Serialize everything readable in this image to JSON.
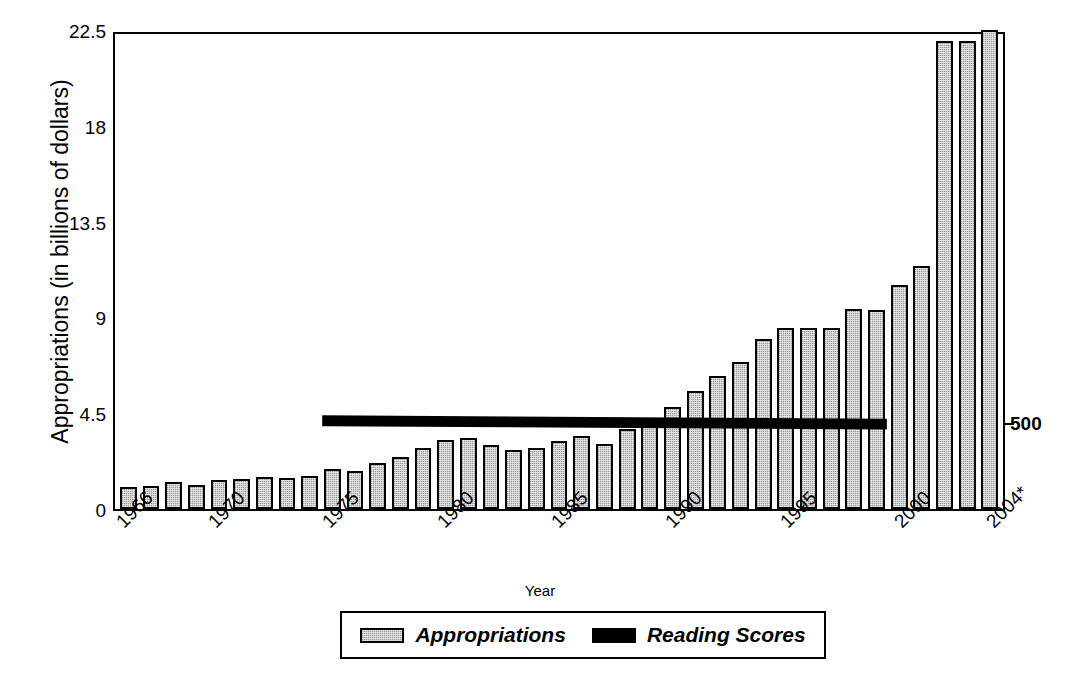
{
  "chart_data": {
    "type": "bar",
    "title": "",
    "xlabel": "Year",
    "ylabel": "Appropriations (in billions of dollars)",
    "ylabel_right": "NAEP Reading Scores",
    "ylim": [
      0,
      22.5
    ],
    "yticks": [
      "0",
      "4.5",
      "9",
      "13.5",
      "18",
      "22.5"
    ],
    "ytick_values": [
      0,
      4.5,
      9,
      13.5,
      18,
      22.5
    ],
    "right_axis_ticks": [
      "500"
    ],
    "right_axis_tick_values": [
      500
    ],
    "grid": false,
    "legend_position": "bottom",
    "categories": [
      "1966",
      "1967",
      "1968",
      "1969",
      "1970",
      "1971",
      "1972",
      "1973",
      "1974",
      "1975",
      "1976",
      "1977",
      "1978",
      "1979",
      "1980",
      "1981",
      "1982",
      "1983",
      "1984",
      "1985",
      "1986",
      "1987",
      "1988",
      "1989",
      "1990",
      "1991",
      "1992",
      "1993",
      "1994",
      "1995",
      "1996",
      "1997",
      "1998",
      "1999",
      "2000",
      "2001",
      "2002",
      "2003",
      "2004*"
    ],
    "xtick_labels": [
      "1966",
      "1970",
      "1975",
      "1980",
      "1985",
      "1990",
      "1995",
      "2000",
      "2004*"
    ],
    "xtick_indices": [
      0,
      4,
      9,
      14,
      19,
      24,
      29,
      34,
      38
    ],
    "series": [
      {
        "name": "Appropriations",
        "type": "bar",
        "color": "#b3b3b3",
        "values": [
          1.05,
          1.1,
          1.25,
          1.15,
          1.35,
          1.4,
          1.5,
          1.45,
          1.55,
          1.9,
          1.8,
          2.15,
          2.45,
          2.85,
          3.25,
          3.35,
          3.0,
          2.75,
          2.85,
          3.2,
          3.45,
          3.05,
          3.75,
          4.0,
          4.8,
          5.55,
          6.25,
          6.9,
          8.0,
          8.5,
          8.5,
          8.5,
          9.4,
          9.35,
          10.5,
          11.4,
          13.7,
          14.9,
          17.3
        ],
        "line_overlay_note": "bars are gray fill with black outline"
      },
      {
        "name": "Reading Scores",
        "type": "line",
        "color": "#000000",
        "axis": "right",
        "start_category": "1975",
        "end_category": "1999",
        "values_flat_near": 500,
        "description": "A thick flat black horizontal line spanning 1975 through 1999 at approximately the 500 NAEP reading score level, showing essentially no change."
      }
    ],
    "extra_tall_bars_note": "2002 and 2003 reach about 22.0; 2004* reaches 22.5 (top of axis)",
    "tall_values_override": {
      "2002": 22.0,
      "2003": 22.0,
      "2004*": 22.5
    }
  },
  "axes": {
    "left_title": "Appropriations (in billions of dollars)",
    "right_title": "NAEP Reading Scores",
    "x_title": "Year"
  },
  "legend": {
    "items": [
      {
        "label": "Appropriations",
        "swatch": "bar-swatch"
      },
      {
        "label": "Reading Scores",
        "swatch": "line-swatch"
      }
    ]
  }
}
